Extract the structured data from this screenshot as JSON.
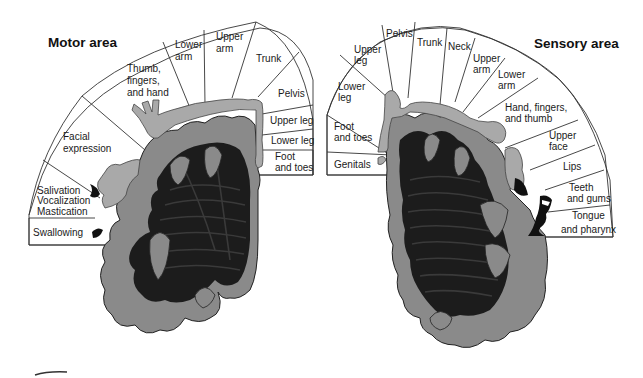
{
  "motor": {
    "title": "Motor area",
    "labels": [
      {
        "id": "swallowing",
        "lines": [
          "Swallowing"
        ]
      },
      {
        "id": "salivation",
        "lines": [
          "Salivation",
          "Vocalization",
          "Mastication"
        ]
      },
      {
        "id": "facial",
        "lines": [
          "Facial",
          "expression"
        ]
      },
      {
        "id": "thumb",
        "lines": [
          "Thumb,",
          "fingers,",
          "and hand"
        ]
      },
      {
        "id": "lower-arm",
        "lines": [
          "Lower",
          "arm"
        ]
      },
      {
        "id": "upper-arm",
        "lines": [
          "Upper",
          "arm"
        ]
      },
      {
        "id": "trunk",
        "lines": [
          "Trunk"
        ]
      },
      {
        "id": "pelvis",
        "lines": [
          "Pelvis"
        ]
      },
      {
        "id": "upper-leg",
        "lines": [
          "Upper leg"
        ]
      },
      {
        "id": "lower-leg",
        "lines": [
          "Lower leg"
        ]
      },
      {
        "id": "foot",
        "lines": [
          "Foot",
          "and toes"
        ]
      }
    ]
  },
  "sensory": {
    "title": "Sensory area",
    "labels": [
      {
        "id": "genitals",
        "lines": [
          "Genitals"
        ]
      },
      {
        "id": "foot",
        "lines": [
          "Foot",
          "and toes"
        ]
      },
      {
        "id": "lower-leg",
        "lines": [
          "Lower",
          "leg"
        ]
      },
      {
        "id": "upper-leg",
        "lines": [
          "Upper",
          "leg"
        ]
      },
      {
        "id": "pelvis",
        "lines": [
          "Pelvis"
        ]
      },
      {
        "id": "trunk",
        "lines": [
          "Trunk"
        ]
      },
      {
        "id": "neck",
        "lines": [
          "Neck"
        ]
      },
      {
        "id": "upper-arm",
        "lines": [
          "Upper",
          "arm"
        ]
      },
      {
        "id": "lower-arm",
        "lines": [
          "Lower",
          "arm"
        ]
      },
      {
        "id": "hand",
        "lines": [
          "Hand, fingers,",
          "and thumb"
        ]
      },
      {
        "id": "upper-face",
        "lines": [
          "Upper",
          "face"
        ]
      },
      {
        "id": "lips",
        "lines": [
          "Lips"
        ]
      },
      {
        "id": "teeth",
        "lines": [
          "Teeth",
          "and gums"
        ]
      },
      {
        "id": "tongue",
        "lines": [
          "Tongue",
          "and pharynx"
        ]
      }
    ]
  },
  "colors": {
    "cortex_gray": "#8a8a8a",
    "white_matter": "#1c1c1c",
    "homunculus": "#a9a9a9",
    "background": "#ffffff"
  }
}
